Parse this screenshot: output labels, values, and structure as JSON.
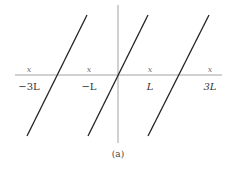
{
  "figure": {
    "caption": "(a)",
    "axes": {
      "horizontal": {
        "x1": 15,
        "x2": 222,
        "y": 75,
        "color": "#8a8a8a"
      },
      "vertical": {
        "x": 118,
        "y1": 5,
        "y2": 143,
        "color": "#8a8a8a"
      }
    },
    "ticks": [
      {
        "position_x": 29,
        "mark": "x",
        "label": "−3L",
        "italic": false
      },
      {
        "position_x": 89,
        "mark": "x",
        "label": "−L",
        "italic": false
      },
      {
        "position_x": 150,
        "mark": "x",
        "label": "L",
        "italic": true
      },
      {
        "position_x": 210,
        "mark": "x",
        "label": "3L",
        "italic": true
      }
    ],
    "lines": [
      {
        "name": "left-line",
        "x1": 27,
        "y1": 136,
        "x2": 87,
        "y2": 15
      },
      {
        "name": "middle-line",
        "x1": 88,
        "y1": 136,
        "x2": 148,
        "y2": 15
      },
      {
        "name": "right-line",
        "x1": 148,
        "y1": 136,
        "x2": 209,
        "y2": 15
      }
    ],
    "line_color": "#222222"
  }
}
